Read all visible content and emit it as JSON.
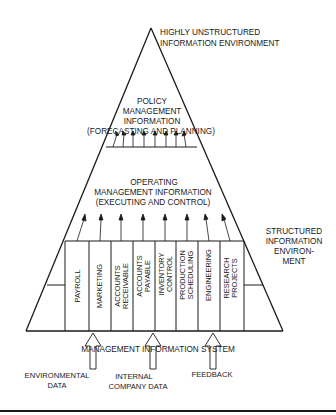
{
  "diagram": {
    "apex_label": {
      "line1": "HIGHLY UNSTRUCTURED",
      "line2": "INFORMATION ENVIRONMENT"
    },
    "policy_level": {
      "line1": "POLICY",
      "line2": "MANAGEMENT",
      "line3": "INFORMATION",
      "line4": "(FORECASTING AND PLANNING)"
    },
    "operating_level": {
      "line1": "OPERATING",
      "line2": "MANAGEMENT INFORMATION",
      "line3": "(EXECUTING AND CONTROL)"
    },
    "structured_label": {
      "line1": "STRUCTURED",
      "line2": "INFORMATION",
      "line3": "ENVIRON-",
      "line4": "MENT"
    },
    "functions": [
      {
        "line1": "PAYROLL",
        "line2": ""
      },
      {
        "line1": "MARKETING",
        "line2": ""
      },
      {
        "line1": "ACCOUNTS",
        "line2": "RECEIVABLE"
      },
      {
        "line1": "ACCOUNTS",
        "line2": "PAYABLE"
      },
      {
        "line1": "INVENTORY",
        "line2": "CONTROL"
      },
      {
        "line1": "PRODUCTION",
        "line2": "SCHEDULING"
      },
      {
        "line1": "ENGINEERING",
        "line2": ""
      },
      {
        "line1": "RESEARCH",
        "line2": "PROJECTS"
      }
    ],
    "base_label": "MANAGEMENT INFORMATION SYSTEM",
    "inputs": [
      {
        "line1": "ENVIRONMENTAL",
        "line2": "DATA"
      },
      {
        "line1": "INTERNAL",
        "line2": "COMPANY DATA"
      },
      {
        "line1": "FEEDBACK",
        "line2": ""
      }
    ],
    "colors": {
      "ink": "#1a1a1a",
      "background": "#ffffff"
    }
  }
}
